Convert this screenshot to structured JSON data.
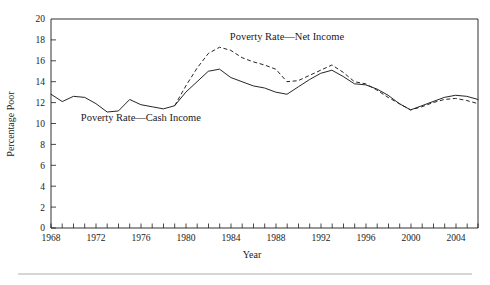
{
  "chart_data": {
    "type": "line",
    "title": "",
    "xlabel": "Year",
    "ylabel": "Percentage Poor",
    "xlim": [
      1968,
      2006
    ],
    "ylim": [
      0,
      20
    ],
    "grid": false,
    "legend_position": "inline-annotations",
    "x_tick_labels": [
      "1968",
      "1972",
      "1976",
      "1980",
      "1984",
      "1988",
      "1992",
      "1996",
      "2000",
      "2004"
    ],
    "x_tick_label_values": [
      1968,
      1972,
      1976,
      1980,
      1984,
      1988,
      1992,
      1996,
      2000,
      2004
    ],
    "x_minor_tick_step": 1,
    "y_tick_labels": [
      "0",
      "2",
      "4",
      "6",
      "8",
      "10",
      "12",
      "14",
      "16",
      "18",
      "20"
    ],
    "y_tick_label_values": [
      0,
      2,
      4,
      6,
      8,
      10,
      12,
      14,
      16,
      18,
      20
    ],
    "annotations": [
      {
        "text": "Poverty Rate—Net Income",
        "series": "net",
        "x": 1989.0,
        "y": 18.0
      },
      {
        "text": "Poverty Rate—Cash Income",
        "series": "cash",
        "x": 1976.0,
        "y": 10.2
      }
    ],
    "x": [
      1968,
      1969,
      1970,
      1971,
      1972,
      1973,
      1974,
      1975,
      1976,
      1977,
      1978,
      1979,
      1980,
      1981,
      1982,
      1983,
      1984,
      1985,
      1986,
      1987,
      1988,
      1989,
      1990,
      1991,
      1992,
      1993,
      1994,
      1995,
      1996,
      1997,
      1998,
      1999,
      2000,
      2001,
      2002,
      2003,
      2004,
      2005,
      2006
    ],
    "series": [
      {
        "name": "Poverty Rate—Cash Income",
        "style": "solid",
        "values": [
          12.8,
          12.1,
          12.6,
          12.5,
          11.9,
          11.1,
          11.2,
          12.3,
          11.8,
          11.6,
          11.4,
          11.7,
          13.0,
          14.0,
          15.0,
          15.2,
          14.4,
          14.0,
          13.6,
          13.4,
          13.0,
          12.8,
          13.5,
          14.2,
          14.8,
          15.1,
          14.5,
          13.8,
          13.7,
          13.3,
          12.7,
          11.9,
          11.3,
          11.7,
          12.1,
          12.5,
          12.7,
          12.6,
          12.3
        ]
      },
      {
        "name": "Poverty Rate—Net Income",
        "style": "dashed",
        "values": [
          null,
          null,
          null,
          null,
          null,
          null,
          null,
          null,
          null,
          null,
          null,
          11.7,
          13.6,
          15.3,
          16.7,
          17.3,
          17.0,
          16.3,
          15.9,
          15.6,
          15.2,
          14.0,
          14.1,
          14.6,
          15.1,
          15.6,
          14.9,
          14.0,
          13.8,
          13.2,
          12.5,
          11.9,
          11.3,
          11.6,
          12.0,
          12.3,
          12.4,
          12.2,
          11.9
        ]
      }
    ]
  },
  "figure": {
    "footer_rule_visible": true
  }
}
